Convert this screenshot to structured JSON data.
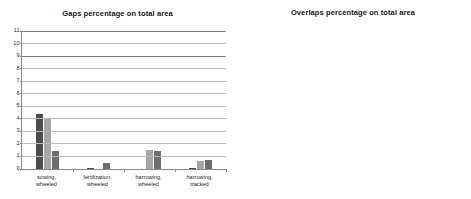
{
  "chart_data": [
    {
      "id": "gaps",
      "type": "bar",
      "title": "Gaps percentage on total area",
      "xlabel": "",
      "ylabel": "",
      "ylim": [
        0,
        11
      ],
      "yticks": [
        0,
        1,
        2,
        3,
        4,
        5,
        6,
        7,
        8,
        9,
        10,
        11
      ],
      "grid": true,
      "legend": "none",
      "categories": [
        "sowing, wheeled",
        "fertilization, wheeled",
        "harrowing, wheeled",
        "harrowing, tracked"
      ],
      "series": [
        {
          "name": "series-1",
          "color": "#4c4c4c",
          "values": [
            4.4,
            0.1,
            0.0,
            0.05
          ]
        },
        {
          "name": "series-2",
          "color": "#a6a6a6",
          "values": [
            3.95,
            0.0,
            1.55,
            0.65
          ]
        },
        {
          "name": "series-3",
          "color": "#6e6e6e",
          "values": [
            1.45,
            0.45,
            1.4,
            0.75
          ]
        }
      ],
      "annotations": []
    },
    {
      "id": "overlaps",
      "type": "bar",
      "title": "Overlaps percentage on total area",
      "xlabel": "",
      "ylabel": "",
      "ylim": [
        0,
        11
      ],
      "yticks": [
        0,
        1,
        2,
        3,
        4,
        5,
        6,
        7,
        8,
        9,
        10,
        11
      ],
      "grid": true,
      "legend": "none",
      "categories": [
        "sowing, wheeled",
        "fertilization, wheeled",
        "harrowing, wheeled",
        "harrowing, tracked"
      ],
      "series": [
        {
          "name": "series-1",
          "color": "#4c4c4c",
          "values": [
            0.5,
            9.3,
            16.3,
            10.6
          ]
        },
        {
          "name": "series-2",
          "color": "#a6a6a6",
          "values": [
            0.95,
            0.4,
            1.7,
            4.4
          ]
        },
        {
          "name": "series-3",
          "color": "#6e6e6e",
          "values": [
            1.15,
            0.0,
            1.25,
            1.0
          ]
        }
      ],
      "annotations": [
        {
          "text": "16.3",
          "group": 2,
          "series": 0
        }
      ]
    }
  ]
}
